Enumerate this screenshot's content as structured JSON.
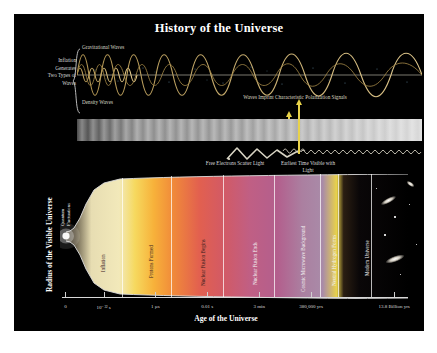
{
  "poster": {
    "title": "History of the Universe",
    "background_color": "#000000"
  },
  "wave_section": {
    "gravitational_label": "Gravitational Waves",
    "density_label": "Density Waves",
    "inflation_brace_label": "Inflation\nGenerates\nTwo Types of\nWaves",
    "polarization_label": "Waves Imprint Characteristic Polarization Signals",
    "wave_color": "#d8b36a",
    "accent_color": "#e8d24a"
  },
  "light_section": {
    "free_electrons_label": "Free Electrons Scatter Light",
    "earliest_time_label": "Earliest Time Visible with Light"
  },
  "chart_data": {
    "type": "area",
    "title": "History of the Universe",
    "xlabel": "Age of the Universe",
    "ylabel": "Radius of the Visible Universe",
    "x_tick_labels": [
      "0",
      "10⁻³² s",
      "1 µs",
      "0.01 s",
      "3 min",
      "380,000 yrs",
      "13.8 Billion yrs"
    ],
    "x_tick_positions_pct": [
      1,
      12,
      27,
      42,
      57,
      72,
      96
    ],
    "eras": [
      {
        "name": "Quantum Fluctuations",
        "start_pct": 0,
        "end_pct": 4,
        "color": "#000000",
        "label_color": "#e8e8e8"
      },
      {
        "name": "Inflation",
        "start_pct": 4,
        "end_pct": 18,
        "color": "#efe7b8",
        "label_color": "#3a2020"
      },
      {
        "name": "Protons Formed",
        "start_pct": 18,
        "end_pct": 32,
        "color": "#f2a53c",
        "label_color": "#3a2020"
      },
      {
        "name": "Nuclear Fusion Begins",
        "start_pct": 32,
        "end_pct": 47,
        "color": "#e2604f",
        "label_color": "#3a2020"
      },
      {
        "name": "Nuclear Fusion Ends",
        "start_pct": 47,
        "end_pct": 62,
        "color": "#b8608c",
        "label_color": "#f2f2f2"
      },
      {
        "name": "Cosmic Microwave Background",
        "start_pct": 62,
        "end_pct": 72,
        "color": "#ab7fa0",
        "label_color": "#f2f2f2"
      },
      {
        "name": "Neutral Hydrogen Forms",
        "start_pct": 72,
        "end_pct": 80,
        "color": "#120c10",
        "label_color": "#e8e8e8"
      },
      {
        "name": "Modern Universe",
        "start_pct": 80,
        "end_pct": 100,
        "color": "#000000",
        "label_color": "#e8e8e8"
      }
    ],
    "cmb_strip_color": "#e8d24a",
    "grid": false,
    "legend": "none"
  }
}
